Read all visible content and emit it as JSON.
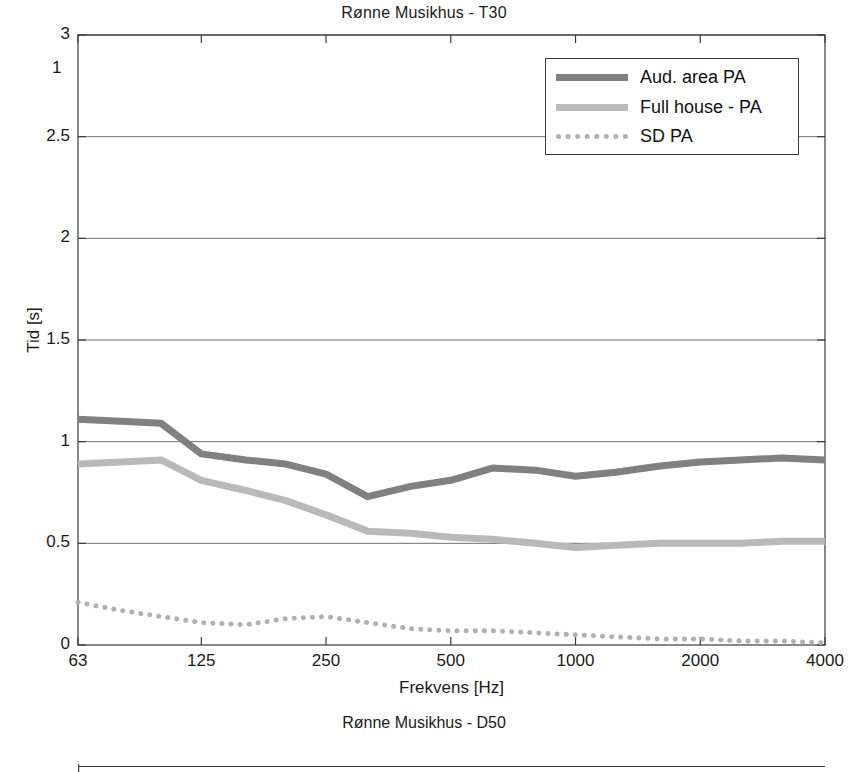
{
  "figure1": {
    "title": "Rønne Musikhus - T30",
    "xlabel": "Frekvens [Hz]",
    "ylabel": "Tid [s]",
    "legend": {
      "items": [
        {
          "label": "Aud. area PA",
          "style": "solid",
          "color": "#808080"
        },
        {
          "label": "Full house - PA",
          "style": "solid",
          "color": "#b9b9b9"
        },
        {
          "label": "SD PA",
          "style": "dotted",
          "color": "#b0b0b0"
        }
      ]
    },
    "yticks": [
      "0",
      "0.5",
      "1",
      "1.5",
      "2",
      "2.5",
      "3"
    ],
    "xticks": [
      "63",
      "125",
      "250",
      "500",
      "1000",
      "2000",
      "4000"
    ]
  },
  "figure2": {
    "title": "Rønne Musikhus - D50",
    "ytick_visible": "1"
  },
  "chart_data": {
    "type": "line",
    "title": "Rønne Musikhus - T30",
    "xlabel": "Frekvens [Hz]",
    "ylabel": "Tid [s]",
    "xscale": "log",
    "xlim": [
      63,
      4000
    ],
    "ylim": [
      0,
      3
    ],
    "yticks": [
      0,
      0.5,
      1,
      1.5,
      2,
      2.5,
      3
    ],
    "xticks": [
      63,
      125,
      250,
      500,
      1000,
      2000,
      4000
    ],
    "grid": "horizontal",
    "legend_position": "upper right",
    "x": [
      63,
      80,
      100,
      125,
      160,
      200,
      250,
      315,
      400,
      500,
      630,
      800,
      1000,
      1250,
      1600,
      2000,
      2500,
      3150,
      4000
    ],
    "series": [
      {
        "name": "Aud. area PA",
        "color": "#808080",
        "style": "solid",
        "values": [
          1.11,
          1.1,
          1.09,
          0.94,
          0.91,
          0.89,
          0.84,
          0.73,
          0.78,
          0.81,
          0.87,
          0.86,
          0.83,
          0.85,
          0.88,
          0.9,
          0.91,
          0.92,
          0.91
        ]
      },
      {
        "name": "Full house - PA",
        "color": "#b9b9b9",
        "style": "solid",
        "values": [
          0.89,
          0.9,
          0.91,
          0.81,
          0.76,
          0.71,
          0.64,
          0.56,
          0.55,
          0.53,
          0.52,
          0.5,
          0.48,
          0.49,
          0.5,
          0.5,
          0.5,
          0.51,
          0.51
        ]
      },
      {
        "name": "SD PA",
        "color": "#b0b0b0",
        "style": "dotted",
        "values": [
          0.21,
          0.17,
          0.14,
          0.11,
          0.1,
          0.13,
          0.14,
          0.11,
          0.08,
          0.07,
          0.07,
          0.06,
          0.05,
          0.04,
          0.03,
          0.03,
          0.02,
          0.02,
          0.01
        ]
      }
    ]
  }
}
